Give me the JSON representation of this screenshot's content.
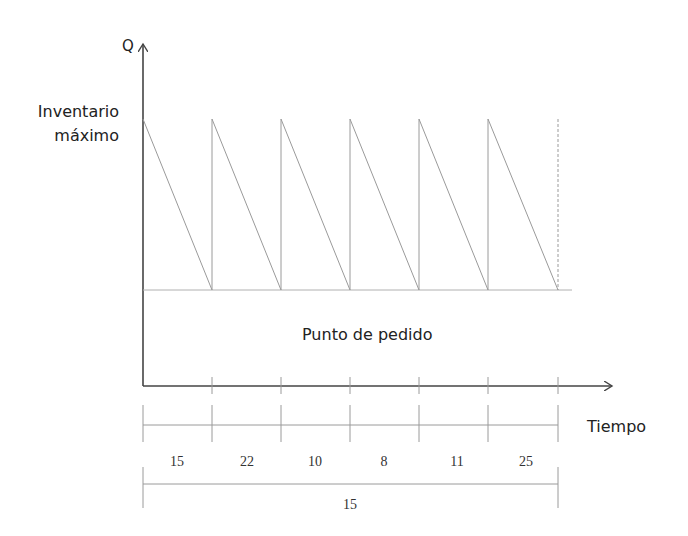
{
  "diagram": {
    "y_axis_label": "Q",
    "x_axis_label": "Tiempo",
    "max_inventory_label_line1": "Inventario",
    "max_inventory_label_line2": "máximo",
    "reorder_point_label": "Punto de pedido",
    "cycles": 6,
    "interval_values": [
      "15",
      "22",
      "10",
      "8",
      "11",
      "25"
    ],
    "total_interval_value": "15",
    "colors": {
      "axis": "#444444",
      "sawtooth": "#9a9a9a",
      "guide": "#b0b0b0",
      "text": "#222222"
    }
  }
}
